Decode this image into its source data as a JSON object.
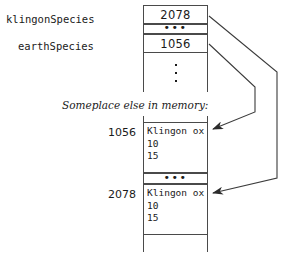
{
  "diagram": {
    "title_caption": "Someplace else in memory:",
    "stack_frame": {
      "variables": [
        {
          "name": "klingonSpecies",
          "value": "2078"
        },
        {
          "name": "earthSpecies",
          "value": "1056"
        }
      ],
      "gap_marker": "•••",
      "vertical_ellipsis": "⋮"
    },
    "heap": {
      "records": [
        {
          "address": "1056",
          "lines": [
            "Klingon ox",
            "10",
            "15"
          ]
        },
        {
          "address": "2078",
          "lines": [
            "Klingon ox",
            "10",
            "15"
          ]
        }
      ],
      "gap_marker": "•••"
    },
    "pointers": [
      {
        "from": "klingonSpecies",
        "to": "2078"
      },
      {
        "from": "earthSpecies",
        "to": "1056"
      }
    ],
    "colors": {
      "line": "#4a4a4a",
      "text": "#1a1a1a",
      "background": "#ffffff"
    }
  }
}
